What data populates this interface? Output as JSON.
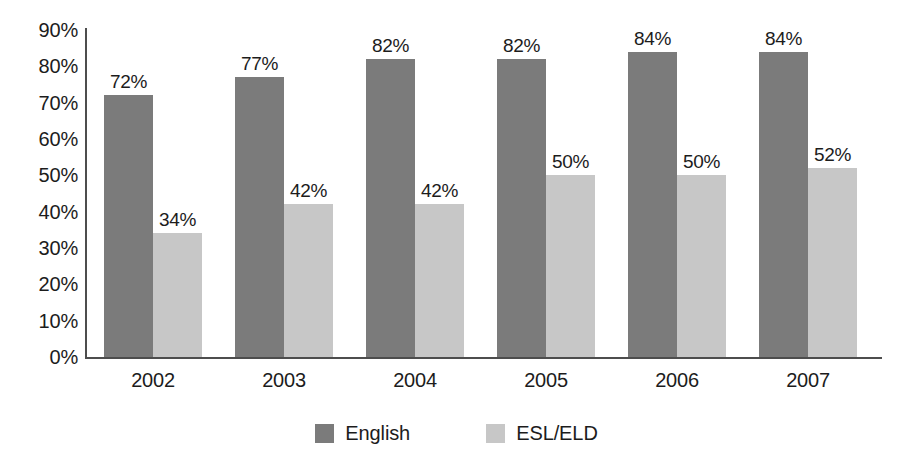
{
  "chart_data": {
    "type": "bar",
    "title": "",
    "subtitle": "",
    "xlabel": "",
    "ylabel": "",
    "categories": [
      "2002",
      "2003",
      "2004",
      "2005",
      "2006",
      "2007"
    ],
    "series": [
      {
        "name": "English",
        "color": "#7b7b7b",
        "values": [
          72,
          77,
          82,
          82,
          84,
          84
        ],
        "labels": [
          "72%",
          "77%",
          "82%",
          "82%",
          "84%",
          "84%"
        ]
      },
      {
        "name": "ESL/ELD",
        "color": "#c7c7c7",
        "values": [
          34,
          42,
          42,
          50,
          50,
          52
        ],
        "labels": [
          "34%",
          "42%",
          "42%",
          "50%",
          "50%",
          "52%"
        ]
      }
    ],
    "ylim": [
      0,
      90
    ],
    "ytick_values": [
      90,
      80,
      70,
      60,
      50,
      40,
      30,
      20,
      10,
      0
    ],
    "ytick_labels": [
      "90%",
      "80%",
      "70%",
      "60%",
      "50%",
      "40%",
      "30%",
      "20%",
      "10%",
      "0%"
    ],
    "grid": false,
    "legend_position": "bottom",
    "axis_color": "#4d4d4d"
  }
}
